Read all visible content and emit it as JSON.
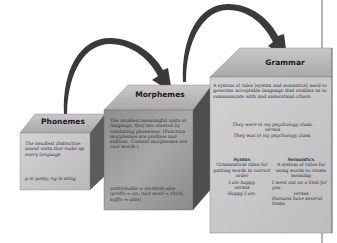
{
  "diagram": {
    "nodes": [
      {
        "id": "phonemes",
        "title": "Phonemes",
        "description": "The smallest distinctive sound units that make up every language",
        "example": "p in patsy; ng in sting"
      },
      {
        "id": "morphemes",
        "title": "Morphemes",
        "description": "The smallest meaningful units of language; they are created by combining phonemes. (Function morphemes are prefixes and suffixes. Content morphemes are root words.)",
        "example": "unthinkable = un-think-able (prefix = un, root word = think, suffix = able)"
      },
      {
        "id": "grammar",
        "title": "Grammar",
        "description": "A system of rules (syntax and semantics) used to generate acceptable language that enables us to communicate with and understand others.",
        "example_line1": "They were in my psychology class.",
        "example_versus": "versus",
        "example_line2": "They was in my psychology class.",
        "syntax": {
          "title": "Syntax",
          "description": "Grammatical rules for putting words in correct order",
          "example_line1": "I am happy.",
          "example_versus": "versus",
          "example_line2": "Happy I am."
        },
        "semantics": {
          "title": "Semantics",
          "description": "A system of rules for using words to create meaning",
          "example_line1": "I went out on a limb for you.",
          "example_versus": "versus",
          "example_line2": "Humans have several limbs."
        }
      }
    ],
    "edges": [
      {
        "from": "phonemes",
        "to": "morphemes"
      },
      {
        "from": "morphemes",
        "to": "grammar"
      }
    ]
  },
  "colors": {
    "front_light": "#c9c9c9",
    "front_mid": "#9a9a9a",
    "side_dark": "#5a5a5a",
    "top_face": "#b5b5b5",
    "arrow": "#3a3a3a"
  }
}
